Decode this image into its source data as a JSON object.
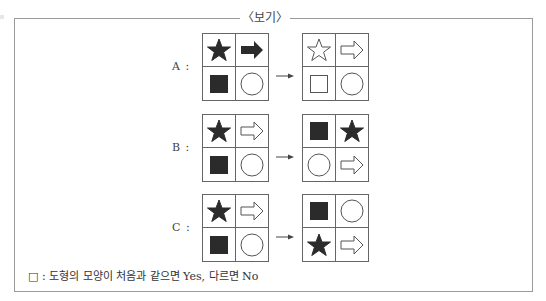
{
  "title": "〈보기〉",
  "rows": [
    {
      "label": "A :",
      "before": [
        "star-filled",
        "arrow-filled",
        "square-filled",
        "circle-outline"
      ],
      "after": [
        "star-outline",
        "arrow-outline",
        "square-outline",
        "circle-outline"
      ]
    },
    {
      "label": "B :",
      "before": [
        "star-filled",
        "arrow-outline",
        "square-filled",
        "circle-outline"
      ],
      "after": [
        "square-filled",
        "star-filled",
        "circle-outline",
        "arrow-outline"
      ]
    },
    {
      "label": "C :",
      "before": [
        "star-filled",
        "arrow-outline",
        "square-filled",
        "circle-outline"
      ],
      "after": [
        "square-filled",
        "circle-outline",
        "star-filled",
        "arrow-outline"
      ]
    }
  ],
  "transform_arrow": "→",
  "footer": "□ : 도형의 모양이 처음과 같으면 Yes, 다르면 No",
  "colors": {
    "fill": "#2b2b2b",
    "stroke": "#555555",
    "border": "#9a9a9a"
  }
}
